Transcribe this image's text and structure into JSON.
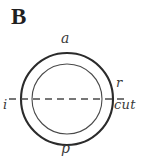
{
  "figure": {
    "panel_letter": "B",
    "background_color": "#ffffff",
    "ink_color": "#2b2b2b",
    "type": "concentric-circle-cross-section-diagram",
    "geometry": {
      "center_x": 67,
      "center_y": 99,
      "outer_circle_radius": 46,
      "inner_circle_radius": 35,
      "outer_circle_stroke_width": 2.1,
      "inner_circle_stroke_width": 1.1,
      "midline_y": 99,
      "midline_x_start": 9,
      "midline_x_end": 128,
      "midline_dash_pattern": "7 5"
    },
    "labels": {
      "anterior": "a",
      "posterior": "p",
      "inferior": "i",
      "right": "r",
      "cut": "cut"
    }
  }
}
